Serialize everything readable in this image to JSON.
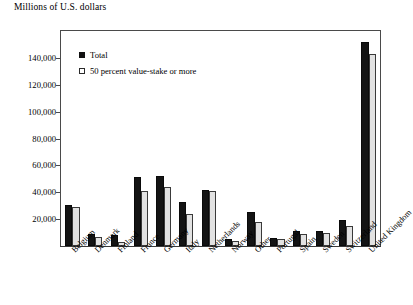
{
  "chart_data": {
    "type": "bar",
    "title": "Millions of U.S. dollars",
    "xlabel": "",
    "ylabel": "Millions of U.S. dollars",
    "ylim": [
      0,
      160000
    ],
    "ytick_labels": [
      "140,000",
      "120,000",
      "100,000",
      "80,000",
      "60,000",
      "40,000",
      "20,000"
    ],
    "ytick_values": [
      140000,
      120000,
      100000,
      80000,
      60000,
      40000,
      20000
    ],
    "grid": false,
    "legend_position": "top-left",
    "categories": [
      "Belgium",
      "Denmark",
      "Finland",
      "France",
      "Germany",
      "Italy",
      "Netherlands",
      "Norway",
      "Other",
      "Portugal",
      "Spain",
      "Sweden",
      "Switzerland",
      "United Kingdom"
    ],
    "series": [
      {
        "name": "Total",
        "color": "#141414",
        "values": [
          30500,
          9000,
          8000,
          51000,
          52000,
          33000,
          42000,
          5000,
          25000,
          6000,
          11000,
          11000,
          19000,
          152000
        ]
      },
      {
        "name": "50 percent value-stake or more",
        "color": "#e2e2e2",
        "values": [
          29000,
          7000,
          3000,
          41000,
          44000,
          24000,
          41000,
          4000,
          18000,
          5000,
          9000,
          10000,
          15000,
          143000
        ]
      }
    ]
  }
}
